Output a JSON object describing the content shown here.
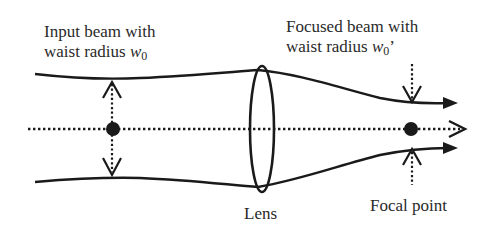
{
  "diagram": {
    "labels": {
      "input_line1": "Input beam with",
      "input_line2_prefix": "waist radius ",
      "input_symbol": "w",
      "input_subscript": "0",
      "focused_line1": "Focused beam with",
      "focused_line2_prefix": "waist radius ",
      "focused_symbol": "w",
      "focused_subscript": "0",
      "focused_prime": "’",
      "lens": "Lens",
      "focal_point": "Focal point"
    },
    "colors": {
      "stroke": "#1a1a1a",
      "text": "#2a2a2a",
      "background": "#ffffff"
    },
    "elements": {
      "optical_axis": {
        "style": "dotted",
        "arrowhead": "open"
      },
      "input_beam_edges": {
        "style": "solid",
        "count": 2
      },
      "lens": {
        "shape": "ellipse"
      },
      "input_waist_marker": {
        "shape": "filled-circle",
        "arrows": "dotted double-headed vertical"
      },
      "focal_point_marker": {
        "shape": "filled-circle",
        "arrows": "dotted converging vertical"
      }
    }
  }
}
